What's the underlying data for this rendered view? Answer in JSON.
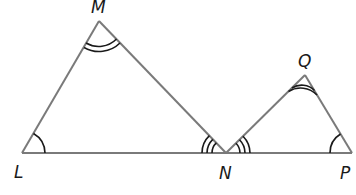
{
  "diagram": {
    "type": "similar-triangles",
    "stroke_color": "#7a7a7a",
    "mark_color": "#1a1a1a",
    "vertices": {
      "M": {
        "x": 99,
        "y": 21
      },
      "L": {
        "x": 22,
        "y": 153
      },
      "N": {
        "x": 226,
        "y": 153
      },
      "Q": {
        "x": 305,
        "y": 75
      },
      "P": {
        "x": 352,
        "y": 153
      }
    },
    "labels": {
      "M": "M",
      "L": "L",
      "N": "N",
      "Q": "Q",
      "P": "P"
    },
    "triangles": [
      {
        "name": "LMN",
        "vertices": [
          "L",
          "M",
          "N"
        ]
      },
      {
        "name": "NQP",
        "vertices": [
          "N",
          "Q",
          "P"
        ]
      }
    ],
    "angle_marks": [
      {
        "vertex": "M",
        "arcs": 2
      },
      {
        "vertex": "L",
        "arcs": 1
      },
      {
        "vertex": "N",
        "triangle": "LMN",
        "arcs": 3
      },
      {
        "vertex": "N",
        "triangle": "NQP",
        "arcs": 3
      },
      {
        "vertex": "Q",
        "arcs": 2
      },
      {
        "vertex": "P",
        "arcs": 1
      }
    ]
  }
}
